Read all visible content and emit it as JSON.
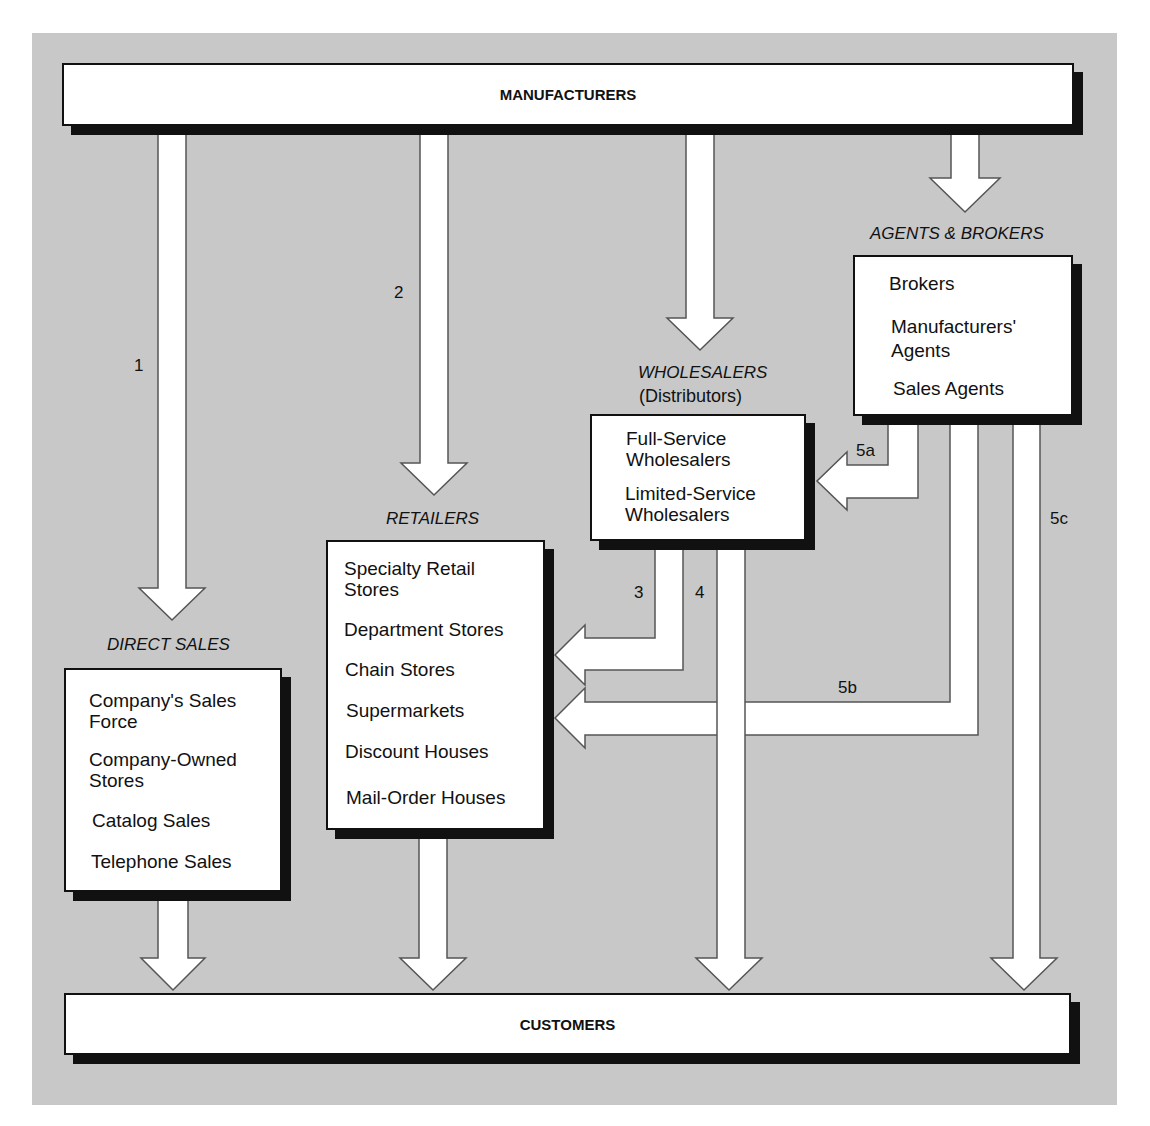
{
  "diagram": {
    "top": "MANUFACTURERS",
    "bottom": "CUSTOMERS",
    "groups": {
      "direct_sales": {
        "heading": "DIRECT SALES",
        "items": [
          "Company's Sales\nForce",
          "Company-Owned\nStores",
          "Catalog Sales",
          "Telephone Sales"
        ]
      },
      "retailers": {
        "heading": "RETAILERS",
        "items": [
          "Specialty Retail\nStores",
          "Department Stores",
          "Chain Stores",
          "Supermarkets",
          "Discount Houses",
          "Mail-Order Houses"
        ]
      },
      "wholesalers": {
        "heading": "WHOLESALERS",
        "subheading": "(Distributors)",
        "items": [
          "Full-Service\nWholesalers",
          "Limited-Service\nWholesalers"
        ]
      },
      "agents_brokers": {
        "heading": "AGENTS & BROKERS",
        "items": [
          "Brokers",
          "Manufacturers'\nAgents",
          "Sales Agents"
        ]
      }
    },
    "channel_labels": {
      "c1": "1",
      "c2": "2",
      "c3": "3",
      "c4": "4",
      "c5a": "5a",
      "c5b": "5b",
      "c5c": "5c"
    },
    "colors": {
      "background": "#c8c8c8",
      "box": "#ffffff",
      "border": "#111111",
      "arrow": "#ffffff",
      "arrow_stroke": "#555555"
    }
  }
}
